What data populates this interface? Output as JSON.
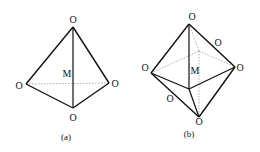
{
  "figure_a": {
    "caption": "(a)",
    "center_label": "M",
    "vertex_labels": {
      "top": "O",
      "left": "O",
      "right": "O",
      "bottom": "O"
    },
    "shape": "tetrahedron"
  },
  "figure_b": {
    "caption": "(b)",
    "center_label": "M",
    "vertex_labels": {
      "top": "O",
      "back": "O",
      "left": "O",
      "right": "O",
      "front": "O",
      "bottom": "O"
    },
    "shape": "octahedron"
  },
  "colors": {
    "line": "#111111",
    "hidden_line": "#999999"
  }
}
